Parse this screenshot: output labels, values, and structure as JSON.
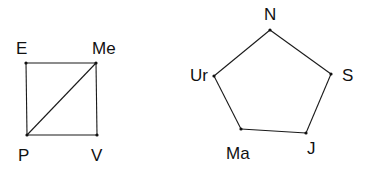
{
  "graphs": [
    {
      "name": "square-graph",
      "nodes": [
        {
          "id": "E",
          "label": "E",
          "x": 26,
          "y": 63,
          "lx": 16,
          "ly": 40
        },
        {
          "id": "Me",
          "label": "Me",
          "x": 96,
          "y": 63,
          "lx": 92,
          "ly": 40
        },
        {
          "id": "P",
          "label": "P",
          "x": 27,
          "y": 135,
          "lx": 18,
          "ly": 147
        },
        {
          "id": "V",
          "label": "V",
          "x": 97,
          "y": 135,
          "lx": 91,
          "ly": 147
        }
      ],
      "edges": [
        [
          "E",
          "Me"
        ],
        [
          "Me",
          "V"
        ],
        [
          "V",
          "P"
        ],
        [
          "P",
          "E"
        ],
        [
          "P",
          "Me"
        ]
      ]
    },
    {
      "name": "pentagon-graph",
      "nodes": [
        {
          "id": "N",
          "label": "N",
          "x": 270,
          "y": 30,
          "lx": 264,
          "ly": 6
        },
        {
          "id": "S",
          "label": "S",
          "x": 331,
          "y": 74,
          "lx": 342,
          "ly": 67
        },
        {
          "id": "J",
          "label": "J",
          "x": 306,
          "y": 133,
          "lx": 307,
          "ly": 140
        },
        {
          "id": "Ma",
          "label": "Ma",
          "x": 241,
          "y": 129,
          "lx": 226,
          "ly": 145
        },
        {
          "id": "Ur",
          "label": "Ur",
          "x": 214,
          "y": 76,
          "lx": 190,
          "ly": 67
        }
      ],
      "edges": [
        [
          "N",
          "S"
        ],
        [
          "S",
          "J"
        ],
        [
          "J",
          "Ma"
        ],
        [
          "Ma",
          "Ur"
        ],
        [
          "Ur",
          "N"
        ]
      ]
    }
  ]
}
